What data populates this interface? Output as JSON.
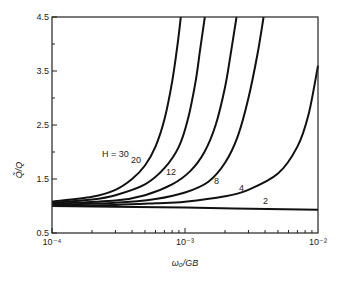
{
  "chart_data": {
    "type": "line",
    "title": "",
    "xlabel": "ω0/GB",
    "ylabel": "Q̃/Q",
    "xscale": "log",
    "xlim": [
      0.0001,
      0.01
    ],
    "ylim": [
      0.5,
      4.5
    ],
    "xticks": [
      {
        "value": 0.0001,
        "label": "10⁻⁴"
      },
      {
        "value": 0.001,
        "label": "10⁻³"
      },
      {
        "value": 0.01,
        "label": "10⁻²"
      }
    ],
    "yticks": [
      {
        "value": 0.5,
        "label": "0.5"
      },
      {
        "value": 1.5,
        "label": "1.5"
      },
      {
        "value": 2.5,
        "label": "2.5"
      },
      {
        "value": 3.5,
        "label": "3.5"
      },
      {
        "value": 4.5,
        "label": "4.5"
      }
    ],
    "grid": false,
    "series": [
      {
        "name": "H = 30",
        "label": "H = 30",
        "x": [
          0.0001,
          0.0002,
          0.0003,
          0.0004,
          0.0005,
          0.0006,
          0.0007,
          0.0008,
          0.00088,
          0.00093
        ],
        "y": [
          1.08,
          1.17,
          1.3,
          1.5,
          1.75,
          2.1,
          2.6,
          3.3,
          4.0,
          4.5
        ]
      },
      {
        "name": "H = 20",
        "label": "20",
        "x": [
          0.0001,
          0.0002,
          0.0003,
          0.0005,
          0.0007,
          0.0009,
          0.00105,
          0.0012,
          0.0013,
          0.00141
        ],
        "y": [
          1.06,
          1.12,
          1.2,
          1.4,
          1.7,
          2.1,
          2.6,
          3.3,
          3.9,
          4.5
        ]
      },
      {
        "name": "H = 12",
        "label": "12",
        "x": [
          0.0001,
          0.0003,
          0.0005,
          0.0008,
          0.0011,
          0.0014,
          0.0017,
          0.002,
          0.0022,
          0.00244
        ],
        "y": [
          1.04,
          1.1,
          1.2,
          1.4,
          1.65,
          2.0,
          2.5,
          3.2,
          3.8,
          4.5
        ]
      },
      {
        "name": "H = 8",
        "label": "8",
        "x": [
          0.0001,
          0.0003,
          0.0006,
          0.001,
          0.0015,
          0.002,
          0.0025,
          0.003,
          0.0035,
          0.0039
        ],
        "y": [
          1.02,
          1.06,
          1.13,
          1.25,
          1.45,
          1.8,
          2.3,
          3.0,
          3.8,
          4.5
        ]
      },
      {
        "name": "H = 4",
        "label": "4",
        "x": [
          0.0001,
          0.0003,
          0.0006,
          0.001,
          0.002,
          0.003,
          0.005,
          0.007,
          0.0085,
          0.01
        ],
        "y": [
          1.0,
          1.02,
          1.05,
          1.08,
          1.18,
          1.3,
          1.6,
          2.1,
          2.7,
          3.6
        ]
      },
      {
        "name": "H = 2",
        "label": "2",
        "x": [
          0.0001,
          0.001,
          0.01
        ],
        "y": [
          1.0,
          0.97,
          0.93
        ]
      }
    ],
    "annotations": [
      "H = 30",
      "20",
      "12",
      "8",
      "4",
      "2"
    ]
  },
  "labels": {
    "xlabel": "ω₀/GB",
    "ylabel": "Q̃/Q"
  }
}
